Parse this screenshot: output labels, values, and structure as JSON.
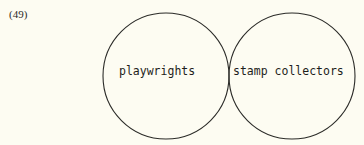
{
  "figure": {
    "number_label": "(49)",
    "type": "venn-diagram",
    "background_color": "#fdfcf2",
    "stroke_color": "#2b2b28"
  },
  "diagram": {
    "left_circle": {
      "label": "playwrights",
      "center_x": 166,
      "center_y": 76,
      "radius": 63
    },
    "right_circle": {
      "label": "stamp collectors",
      "center_x": 292,
      "center_y": 76,
      "radius": 63
    },
    "overlap_region": {
      "label": "",
      "top_crossing_y": 48,
      "bottom_crossing_y": 104,
      "crossing_x": 229
    }
  }
}
